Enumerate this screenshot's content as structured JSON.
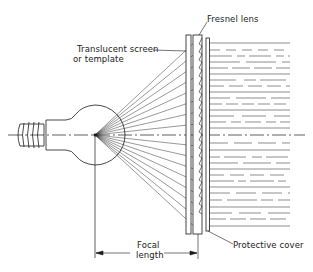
{
  "diagram": {
    "type": "technical illustration",
    "labels": {
      "fresnel_lens": "Fresnel lens",
      "translucent_screen_line1": "Translucent screen",
      "translucent_screen_line2": "or template",
      "focal_line1": "Focal",
      "focal_line2": "length",
      "protective_cover": "Protective cover"
    },
    "caption_cropped": ""
  },
  "colors": {
    "line": "#1a1a1a",
    "background": "#ffffff"
  }
}
